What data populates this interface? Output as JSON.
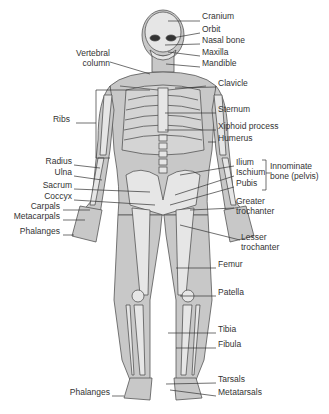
{
  "colors": {
    "body": "#c8c8c8",
    "bone": "#e2e2e2",
    "outline": "#444444",
    "text": "#333333"
  },
  "labels_right": [
    {
      "id": "cranium",
      "text": "Cranium",
      "x": 202,
      "y": 16
    },
    {
      "id": "orbit",
      "text": "Orbit",
      "x": 202,
      "y": 29
    },
    {
      "id": "nasal",
      "text": "Nasal bone",
      "x": 202,
      "y": 40
    },
    {
      "id": "maxilla",
      "text": "Maxilla",
      "x": 202,
      "y": 52
    },
    {
      "id": "mandible",
      "text": "Mandible",
      "x": 202,
      "y": 63
    },
    {
      "id": "clavicle",
      "text": "Clavicle",
      "x": 218,
      "y": 83
    },
    {
      "id": "sternum",
      "text": "Sternum",
      "x": 218,
      "y": 109
    },
    {
      "id": "xiphoid",
      "text": "Xiphoid process",
      "x": 218,
      "y": 126
    },
    {
      "id": "humerus",
      "text": "Humerus",
      "x": 218,
      "y": 138
    },
    {
      "id": "ilium",
      "text": "Ilium",
      "x": 236,
      "y": 162
    },
    {
      "id": "ischium",
      "text": "Ischium",
      "x": 236,
      "y": 172
    },
    {
      "id": "pubis",
      "text": "Pubis",
      "x": 236,
      "y": 183
    },
    {
      "id": "greater-troch",
      "text": "Greater\ntrochanter",
      "x": 236,
      "y": 201
    },
    {
      "id": "lesser-troch",
      "text": "Lesser\ntrochanter",
      "x": 241,
      "y": 237
    },
    {
      "id": "femur",
      "text": "Femur",
      "x": 218,
      "y": 264
    },
    {
      "id": "patella",
      "text": "Patella",
      "x": 218,
      "y": 292
    },
    {
      "id": "tibia",
      "text": "Tibia",
      "x": 218,
      "y": 329
    },
    {
      "id": "fibula",
      "text": "Fibula",
      "x": 218,
      "y": 344
    },
    {
      "id": "tarsals",
      "text": "Tarsals",
      "x": 218,
      "y": 379
    },
    {
      "id": "metatarsals",
      "text": "Metatarsals",
      "x": 218,
      "y": 392
    }
  ],
  "labels_left": [
    {
      "id": "vertebral",
      "text": "Vertebral\ncolumn",
      "x": 110,
      "y": 53
    },
    {
      "id": "ribs",
      "text": "Ribs",
      "x": 70,
      "y": 119
    },
    {
      "id": "radius",
      "text": "Radius",
      "x": 72,
      "y": 161
    },
    {
      "id": "ulna",
      "text": "Ulna",
      "x": 72,
      "y": 172
    },
    {
      "id": "sacrum",
      "text": "Sacrum",
      "x": 72,
      "y": 185
    },
    {
      "id": "coccyx",
      "text": "Coccyx",
      "x": 72,
      "y": 196
    },
    {
      "id": "carpals",
      "text": "Carpals",
      "x": 60,
      "y": 206
    },
    {
      "id": "metacarpals",
      "text": "Metacarpals",
      "x": 60,
      "y": 216
    },
    {
      "id": "phalanges-hand",
      "text": "Phalanges",
      "x": 60,
      "y": 231
    },
    {
      "id": "phalanges-foot",
      "text": "Phalanges",
      "x": 110,
      "y": 392
    }
  ],
  "group_label": {
    "text": "Innominate\nbone (pelvis)",
    "x": 270,
    "y": 169
  }
}
